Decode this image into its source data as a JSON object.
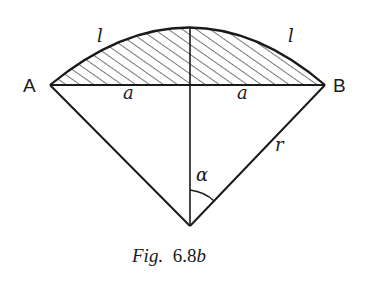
{
  "figure": {
    "caption_prefix": "Fig.",
    "caption_number": "6.8",
    "caption_suffix": "b"
  },
  "labels": {
    "point_a": "A",
    "point_b": "B",
    "arc_left": "l",
    "arc_right": "l",
    "half_chord_left": "a",
    "half_chord_right": "a",
    "radius": "r",
    "angle": "α"
  },
  "geometry": {
    "A": [
      50,
      85
    ],
    "B": [
      325,
      85
    ],
    "center": [
      190,
      226
    ],
    "arc_top": [
      190,
      27
    ],
    "stroke_color": "#1a1a1a",
    "hatch": "diagonal"
  }
}
